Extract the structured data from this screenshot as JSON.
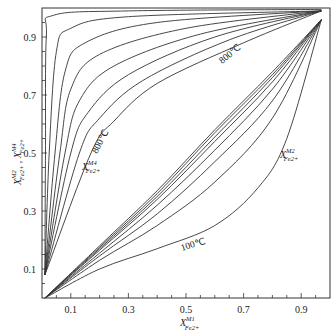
{
  "chart_data": {
    "type": "line",
    "title": "",
    "xlabel": "X_Fe2+^M1",
    "ylabel": "X_Fe2+^M2 , X_Fe2+^M4",
    "xlim": [
      0,
      1
    ],
    "ylim": [
      0,
      1
    ],
    "x_ticks": [
      0.1,
      0.3,
      0.5,
      0.7,
      0.9
    ],
    "y_ticks": [
      0.1,
      0.3,
      0.5,
      0.7,
      0.9
    ],
    "grid": false,
    "legend": "none",
    "annotations": [
      {
        "text": "800℃",
        "near": "M4 outermost curve",
        "x": 0.25,
        "y": 0.7
      },
      {
        "text": "X_Fe2+^M4",
        "x": 0.17,
        "y": 0.45
      },
      {
        "text": "800℃",
        "near": "M2 upper curve",
        "x": 0.62,
        "y": 0.83
      },
      {
        "text": "X_Fe2+^M2",
        "x": 0.87,
        "y": 0.46
      },
      {
        "text": "100℃",
        "near": "M2 lowest curve",
        "x": 0.5,
        "y": 0.18
      }
    ],
    "families": [
      {
        "name": "X_Fe2+^M4",
        "temperature_range": "100℃ (innermost) to 800℃ (outermost)",
        "series": [
          {
            "name": "M4-1",
            "points": [
              [
                0.01,
                0.08
              ],
              [
                0.012,
                0.5
              ],
              [
                0.015,
                0.9
              ],
              [
                0.04,
                0.975
              ],
              [
                0.3,
                0.99
              ],
              [
                0.97,
                0.995
              ]
            ]
          },
          {
            "name": "M4-2",
            "points": [
              [
                0.01,
                0.08
              ],
              [
                0.025,
                0.5
              ],
              [
                0.05,
                0.85
              ],
              [
                0.1,
                0.93
              ],
              [
                0.3,
                0.97
              ],
              [
                0.97,
                0.99
              ]
            ]
          },
          {
            "name": "M4-3",
            "points": [
              [
                0.01,
                0.08
              ],
              [
                0.045,
                0.5
              ],
              [
                0.08,
                0.78
              ],
              [
                0.15,
                0.88
              ],
              [
                0.4,
                0.95
              ],
              [
                0.97,
                0.99
              ]
            ]
          },
          {
            "name": "M4-4",
            "points": [
              [
                0.01,
                0.08
              ],
              [
                0.062,
                0.5
              ],
              [
                0.1,
                0.72
              ],
              [
                0.2,
                0.84
              ],
              [
                0.5,
                0.93
              ],
              [
                0.97,
                0.99
              ]
            ]
          },
          {
            "name": "M4-5",
            "points": [
              [
                0.01,
                0.08
              ],
              [
                0.08,
                0.5
              ],
              [
                0.13,
                0.68
              ],
              [
                0.25,
                0.8
              ],
              [
                0.55,
                0.91
              ],
              [
                0.97,
                0.99
              ]
            ]
          },
          {
            "name": "M4-6",
            "points": [
              [
                0.01,
                0.08
              ],
              [
                0.1,
                0.5
              ],
              [
                0.16,
                0.64
              ],
              [
                0.3,
                0.77
              ],
              [
                0.6,
                0.9
              ],
              [
                0.97,
                0.99
              ]
            ]
          },
          {
            "name": "M4-7",
            "points": [
              [
                0.01,
                0.08
              ],
              [
                0.13,
                0.5
              ],
              [
                0.2,
                0.62
              ],
              [
                0.35,
                0.75
              ],
              [
                0.65,
                0.89
              ],
              [
                0.97,
                0.99
              ]
            ]
          },
          {
            "name": "M4-8 (800℃)",
            "points": [
              [
                0.01,
                0.08
              ],
              [
                0.17,
                0.5
              ],
              [
                0.25,
                0.61
              ],
              [
                0.4,
                0.74
              ],
              [
                0.7,
                0.88
              ],
              [
                0.97,
                0.99
              ]
            ]
          }
        ]
      },
      {
        "name": "X_Fe2+^M2",
        "temperature_range": "800℃ (uppermost) to 100℃ (lowest)",
        "series": [
          {
            "name": "M2-1 (800℃)",
            "points": [
              [
                0.01,
                0
              ],
              [
                0.2,
                0.18
              ],
              [
                0.4,
                0.37
              ],
              [
                0.6,
                0.58
              ],
              [
                0.8,
                0.78
              ],
              [
                0.97,
                0.96
              ]
            ]
          },
          {
            "name": "M2-2",
            "points": [
              [
                0.01,
                0
              ],
              [
                0.2,
                0.175
              ],
              [
                0.4,
                0.36
              ],
              [
                0.6,
                0.57
              ],
              [
                0.8,
                0.77
              ],
              [
                0.97,
                0.96
              ]
            ]
          },
          {
            "name": "M2-3",
            "points": [
              [
                0.01,
                0
              ],
              [
                0.2,
                0.17
              ],
              [
                0.4,
                0.35
              ],
              [
                0.6,
                0.555
              ],
              [
                0.8,
                0.76
              ],
              [
                0.97,
                0.96
              ]
            ]
          },
          {
            "name": "M2-4",
            "points": [
              [
                0.01,
                0
              ],
              [
                0.2,
                0.165
              ],
              [
                0.4,
                0.34
              ],
              [
                0.6,
                0.54
              ],
              [
                0.8,
                0.745
              ],
              [
                0.97,
                0.96
              ]
            ]
          },
          {
            "name": "M2-5",
            "points": [
              [
                0.01,
                0
              ],
              [
                0.2,
                0.155
              ],
              [
                0.4,
                0.32
              ],
              [
                0.6,
                0.51
              ],
              [
                0.8,
                0.72
              ],
              [
                0.97,
                0.96
              ]
            ]
          },
          {
            "name": "M2-6",
            "points": [
              [
                0.01,
                0
              ],
              [
                0.2,
                0.145
              ],
              [
                0.4,
                0.29
              ],
              [
                0.6,
                0.47
              ],
              [
                0.8,
                0.68
              ],
              [
                0.97,
                0.96
              ]
            ]
          },
          {
            "name": "M2-7",
            "points": [
              [
                0.01,
                0
              ],
              [
                0.2,
                0.13
              ],
              [
                0.4,
                0.25
              ],
              [
                0.6,
                0.4
              ],
              [
                0.8,
                0.62
              ],
              [
                0.97,
                0.96
              ]
            ]
          },
          {
            "name": "M2-8 (100℃)",
            "points": [
              [
                0.01,
                0
              ],
              [
                0.2,
                0.1
              ],
              [
                0.4,
                0.17
              ],
              [
                0.6,
                0.25
              ],
              [
                0.75,
                0.38
              ],
              [
                0.85,
                0.55
              ],
              [
                0.97,
                0.96
              ]
            ]
          }
        ]
      }
    ]
  },
  "labels": {
    "x_axis": "X",
    "x_axis_sup": "M1",
    "x_axis_sub": "Fe2+",
    "y_axis": "X",
    "y_axis_sup1": "M2",
    "y_axis_sub": "Fe2+",
    "y_axis_sep": " , ",
    "y_axis_sup2": "M4",
    "m4_label": "X",
    "m4_sup": "M4",
    "m4_sub": "Fe2+",
    "m2_label": "X",
    "m2_sup": "M2",
    "m2_sub": "Fe2+",
    "t800_m4": "800℃",
    "t800_m2": "800℃",
    "t100_m2": "100℃"
  }
}
